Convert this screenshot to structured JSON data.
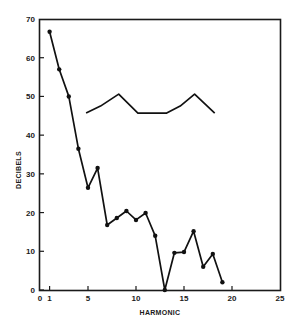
{
  "chart_data": {
    "type": "line",
    "title": "",
    "xlabel": "HARMONIC",
    "ylabel": "DECIBELS",
    "xlim": [
      0,
      25
    ],
    "ylim": [
      0,
      70
    ],
    "x_ticks": [
      0,
      1,
      5,
      10,
      15,
      20,
      25
    ],
    "y_ticks": [
      0,
      10,
      20,
      30,
      40,
      50,
      60,
      70
    ],
    "grid": false,
    "legend": null,
    "series": [
      {
        "name": "harmonic amplitudes",
        "markers": true,
        "x": [
          1,
          2,
          3,
          4,
          5,
          6,
          7,
          8,
          9,
          10,
          11,
          12,
          13,
          14,
          15,
          16,
          17,
          18,
          19
        ],
        "values": [
          66.7,
          57,
          50,
          36.5,
          26.4,
          31.5,
          16.8,
          18.6,
          20.4,
          18.1,
          19.9,
          14,
          0,
          9.6,
          9.8,
          15.2,
          6,
          9.3,
          2
        ]
      },
      {
        "name": "envelope curve",
        "markers": false,
        "x": [
          4.8,
          6.3,
          8.2,
          10.2,
          13.2,
          14.6,
          16.1,
          18.2
        ],
        "values": [
          45.7,
          47.5,
          50.6,
          45.7,
          45.7,
          47.5,
          50.6,
          45.7
        ]
      }
    ]
  }
}
